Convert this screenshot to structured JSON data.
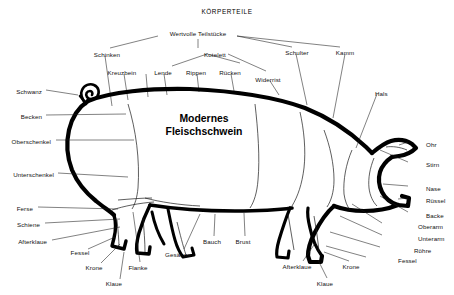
{
  "heading": "KÖRPERTEILE",
  "center_title_line1": "Modernes",
  "center_title_line2": "Fleischschwein",
  "cuts_group_label": "Wertvolle  Teilstücke",
  "colors": {
    "outline": "#000000",
    "leader": "#1a1a1a",
    "background": "#ffffff"
  },
  "labels": {
    "top": [
      {
        "text": "Schinken",
        "x": 107,
        "y": 52
      },
      {
        "text": "Kotelett",
        "x": 215,
        "y": 52
      },
      {
        "text": "Schulter",
        "x": 297,
        "y": 50
      },
      {
        "text": "Kamm",
        "x": 345,
        "y": 50
      },
      {
        "text": "Kreuzbein",
        "x": 122,
        "y": 70
      },
      {
        "text": "Lende",
        "x": 163,
        "y": 70
      },
      {
        "text": "Rippen",
        "x": 196,
        "y": 70
      },
      {
        "text": "Rücken",
        "x": 230,
        "y": 70
      },
      {
        "text": "Widerrist",
        "x": 268,
        "y": 77
      }
    ],
    "left": [
      {
        "text": "Schwanz",
        "x": 42,
        "y": 89
      },
      {
        "text": "Becken",
        "x": 42,
        "y": 114
      },
      {
        "text": "Oberschenkel",
        "x": 51,
        "y": 139
      },
      {
        "text": "Unterschenkel",
        "x": 54,
        "y": 172
      },
      {
        "text": "Ferse",
        "x": 33,
        "y": 206
      },
      {
        "text": "Schiene",
        "x": 40,
        "y": 222
      },
      {
        "text": "Afterklaue",
        "x": 47,
        "y": 239
      }
    ],
    "left_lower": [
      {
        "text": "Fessel",
        "x": 80,
        "y": 250
      },
      {
        "text": "Krone",
        "x": 94,
        "y": 265
      },
      {
        "text": "Klaue",
        "x": 114,
        "y": 281
      },
      {
        "text": "Flanke",
        "x": 138,
        "y": 265
      }
    ],
    "bottom": [
      {
        "text": "Gesäuge",
        "x": 178,
        "y": 252
      },
      {
        "text": "Bauch",
        "x": 212,
        "y": 239
      },
      {
        "text": "Brust",
        "x": 243,
        "y": 239
      },
      {
        "text": "Afterklaue",
        "x": 297,
        "y": 264
      },
      {
        "text": "Klaue",
        "x": 325,
        "y": 281
      },
      {
        "text": "Krone",
        "x": 351,
        "y": 264
      }
    ],
    "right": [
      {
        "text": "Hals",
        "x": 375,
        "y": 91
      },
      {
        "text": "Ohr",
        "x": 426,
        "y": 142
      },
      {
        "text": "Stirn",
        "x": 426,
        "y": 162
      },
      {
        "text": "Nase",
        "x": 426,
        "y": 186
      },
      {
        "text": "Rüssel",
        "x": 426,
        "y": 198
      },
      {
        "text": "Backe",
        "x": 426,
        "y": 213
      },
      {
        "text": "Oberarm",
        "x": 418,
        "y": 224
      },
      {
        "text": "Unterarm",
        "x": 418,
        "y": 236
      },
      {
        "text": "Röhre",
        "x": 414,
        "y": 248
      },
      {
        "text": "Fessel",
        "x": 398,
        "y": 258
      }
    ]
  }
}
